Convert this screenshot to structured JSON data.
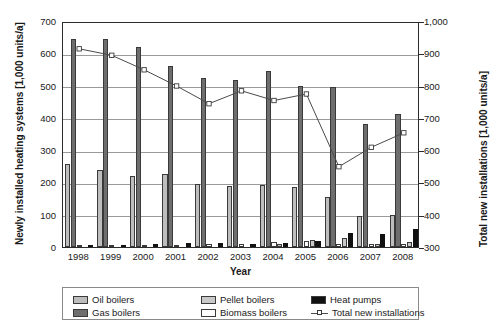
{
  "chart_data": {
    "type": "bar",
    "title": "",
    "xlabel": "Year",
    "ylabel": "Newly installed heating systems [1,000 units/a]",
    "y2label": "Total new installations [1,000 units/a]",
    "categories": [
      "1998",
      "1999",
      "2000",
      "2001",
      "2002",
      "2003",
      "2004",
      "2005",
      "2006",
      "2007",
      "2008"
    ],
    "ylim": [
      0,
      700
    ],
    "ytick_labels": [
      "0",
      "100",
      "200",
      "300",
      "400",
      "500",
      "600",
      "700"
    ],
    "y2lim": [
      300,
      1000
    ],
    "y2tick_labels": [
      "300",
      "400",
      "500",
      "600",
      "700",
      "800",
      "900",
      "1,000"
    ],
    "grid": true,
    "legend_position": "bottom",
    "series": [
      {
        "name": "Oil boilers",
        "axis": "left",
        "kind": "bar",
        "color": "#bdbdbd",
        "values": [
          256,
          240,
          220,
          225,
          196,
          190,
          193,
          186,
          155,
          96,
          100
        ]
      },
      {
        "name": "Gas boilers",
        "axis": "left",
        "kind": "bar",
        "color": "#6e6e6e",
        "values": [
          645,
          643,
          618,
          560,
          523,
          518,
          545,
          500,
          497,
          381,
          411
        ]
      },
      {
        "name": "Biomass boilers",
        "axis": "left",
        "kind": "bar",
        "color": "#ffffff",
        "values": [
          4,
          4,
          5,
          6,
          8,
          10,
          14,
          20,
          8,
          8,
          9
        ]
      },
      {
        "name": "Pellet boilers",
        "axis": "left",
        "kind": "bar",
        "color": "#c9c9c9",
        "values": [
          0,
          0,
          0,
          0,
          0,
          0,
          10,
          22,
          28,
          10,
          14
        ]
      },
      {
        "name": "Heat pumps",
        "axis": "left",
        "kind": "bar",
        "color": "#111111",
        "values": [
          7,
          6,
          8,
          11,
          11,
          10,
          13,
          18,
          44,
          41,
          57
        ]
      },
      {
        "name": "Total new installations",
        "axis": "right",
        "kind": "line",
        "color": "#4a4a4a",
        "values": [
          920,
          900,
          855,
          805,
          750,
          790,
          760,
          780,
          555,
          615,
          660
        ]
      }
    ]
  },
  "legend": {
    "items": [
      {
        "label": "Oil boilers",
        "marker": "swatch-oil"
      },
      {
        "label": "Gas boilers",
        "marker": "swatch-gas"
      },
      {
        "label": "Pellet boilers",
        "marker": "swatch-pellet"
      },
      {
        "label": "Biomass boilers",
        "marker": "swatch-biomass"
      },
      {
        "label": "Heat pumps",
        "marker": "swatch-heatpump"
      },
      {
        "label": "Total new installations",
        "marker": "swatch-line"
      }
    ]
  }
}
